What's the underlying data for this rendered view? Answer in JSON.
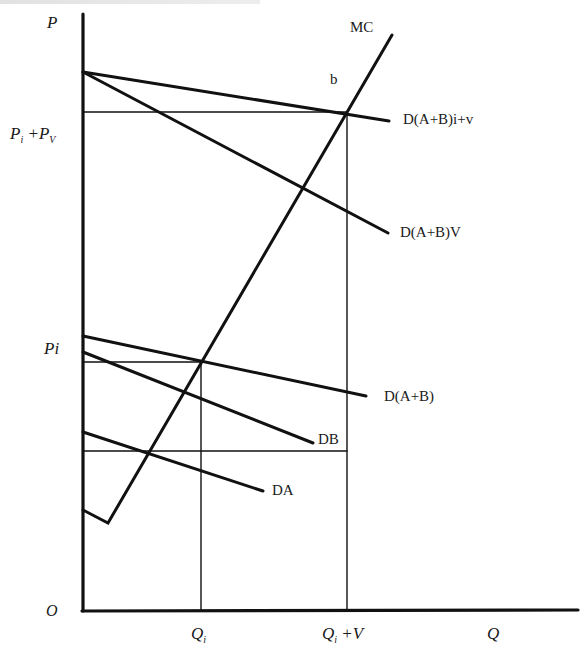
{
  "diagram": {
    "type": "economics supply-demand diagram (public good vertical summation)",
    "axes": {
      "y_label": "P",
      "x_label": "Q",
      "origin_label": "O"
    },
    "y_ticks": {
      "pi_pv": {
        "main": "P",
        "sub1": "i",
        "plus": " +P",
        "sub2": "V"
      },
      "pi": "Pi"
    },
    "x_ticks": {
      "qi": {
        "main": "Q",
        "sub": "i"
      },
      "qi_v": {
        "main": "Q",
        "sub": "i",
        "rest": " +V"
      }
    },
    "curves": {
      "mc": "MC",
      "point_b": "b",
      "d_ab_iv": "D(A+B)i+v",
      "d_ab_v": "D(A+B)V",
      "d_ab": "D(A+B)",
      "db": "DB",
      "da": "DA"
    },
    "colors": {
      "line": "#111111",
      "background": "#ffffff"
    }
  }
}
